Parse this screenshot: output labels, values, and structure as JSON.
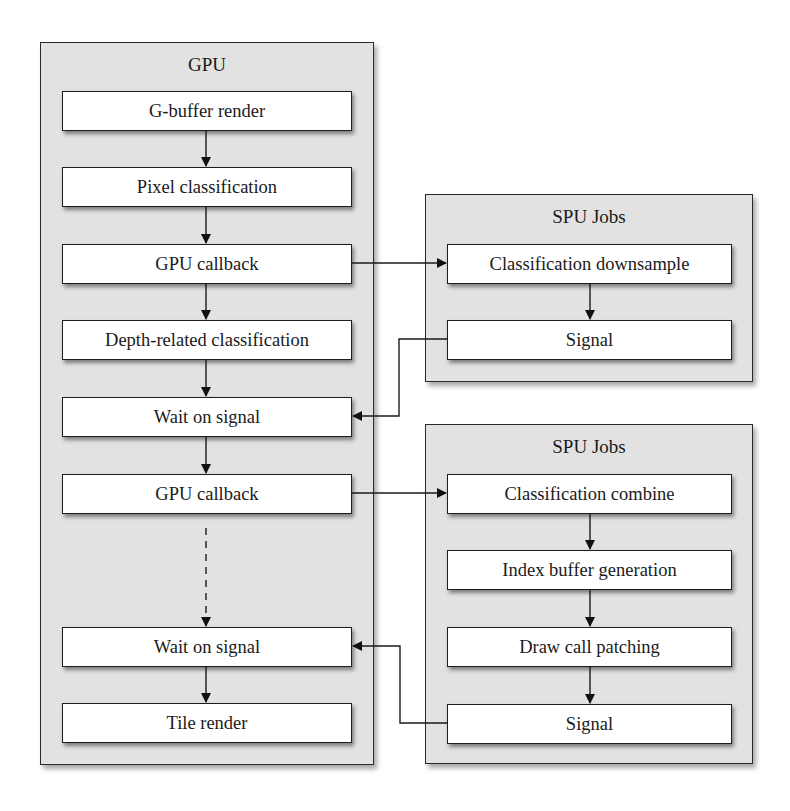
{
  "gpu": {
    "title": "GPU",
    "steps": [
      {
        "label": "G-buffer render"
      },
      {
        "label": "Pixel classification"
      },
      {
        "label": "GPU callback"
      },
      {
        "label": "Depth-related classification"
      },
      {
        "label": "Wait on signal"
      },
      {
        "label": "GPU callback"
      },
      {
        "label": "Wait on signal"
      },
      {
        "label": "Tile render"
      }
    ]
  },
  "spu_group_1": {
    "title": "SPU Jobs",
    "steps": [
      {
        "label": "Classification downsample"
      },
      {
        "label": "Signal"
      }
    ]
  },
  "spu_group_2": {
    "title": "SPU Jobs",
    "steps": [
      {
        "label": "Classification combine"
      },
      {
        "label": "Index buffer generation"
      },
      {
        "label": "Draw call patching"
      },
      {
        "label": "Signal"
      }
    ]
  },
  "connections": [
    {
      "from": "GPU callback (1)",
      "to": "Classification downsample",
      "style": "solid"
    },
    {
      "from": "Signal (SPU 1)",
      "to": "Wait on signal (1)",
      "style": "solid"
    },
    {
      "from": "GPU callback (2)",
      "to": "Classification combine",
      "style": "solid"
    },
    {
      "from": "GPU callback (2)",
      "to": "Wait on signal (2)",
      "style": "dashed"
    },
    {
      "from": "Signal (SPU 2)",
      "to": "Wait on signal (2)",
      "style": "solid"
    }
  ],
  "colors": {
    "panel_fill": "#e2e2e2",
    "box_fill": "#ffffff",
    "stroke": "#1e1e1e"
  }
}
